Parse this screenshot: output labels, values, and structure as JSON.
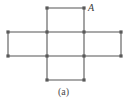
{
  "figure": {
    "caption": "(a)",
    "caption_x": 0,
    "caption_y": 86,
    "width": 127,
    "height": 103,
    "background": "#ffffff",
    "edge_color": "#8c8c8c",
    "edge_width": 1.6,
    "node_color": "#5a5a5a",
    "node_size": 3.2,
    "label_color": "#3a3a3a"
  },
  "labels": [
    {
      "text": "A",
      "x": 88,
      "y": 3,
      "target_vertex": "c2r0"
    }
  ],
  "diagram_data": {
    "type": "polyomino-grid-graph",
    "shape": "cross-pentomino",
    "columns_x": [
      8,
      47,
      84,
      121
    ],
    "rows_y": [
      8,
      32,
      56,
      80
    ],
    "cells": [
      {
        "id": "top",
        "col": 1,
        "row": 0
      },
      {
        "id": "left",
        "col": 0,
        "row": 1
      },
      {
        "id": "center",
        "col": 1,
        "row": 1
      },
      {
        "id": "right",
        "col": 2,
        "row": 1
      },
      {
        "id": "bottom",
        "col": 1,
        "row": 2
      }
    ],
    "vertices": [
      {
        "id": "c1r0",
        "x": 47,
        "y": 8
      },
      {
        "id": "c2r0",
        "x": 84,
        "y": 8
      },
      {
        "id": "c0r1",
        "x": 8,
        "y": 32
      },
      {
        "id": "c1r1",
        "x": 47,
        "y": 32
      },
      {
        "id": "c2r1",
        "x": 84,
        "y": 32
      },
      {
        "id": "c3r1",
        "x": 121,
        "y": 32
      },
      {
        "id": "c0r2",
        "x": 8,
        "y": 56
      },
      {
        "id": "c1r2",
        "x": 47,
        "y": 56
      },
      {
        "id": "c2r2",
        "x": 84,
        "y": 56
      },
      {
        "id": "c3r2",
        "x": 121,
        "y": 56
      },
      {
        "id": "c1r3",
        "x": 47,
        "y": 80
      },
      {
        "id": "c2r3",
        "x": 84,
        "y": 80
      }
    ],
    "edges": [
      {
        "from": "c1r0",
        "to": "c2r0"
      },
      {
        "from": "c1r0",
        "to": "c1r1"
      },
      {
        "from": "c2r0",
        "to": "c2r1"
      },
      {
        "from": "c0r1",
        "to": "c1r1"
      },
      {
        "from": "c1r1",
        "to": "c2r1"
      },
      {
        "from": "c2r1",
        "to": "c3r1"
      },
      {
        "from": "c0r1",
        "to": "c0r2"
      },
      {
        "from": "c1r1",
        "to": "c1r2"
      },
      {
        "from": "c2r1",
        "to": "c2r2"
      },
      {
        "from": "c3r1",
        "to": "c3r2"
      },
      {
        "from": "c0r2",
        "to": "c1r2"
      },
      {
        "from": "c1r2",
        "to": "c2r2"
      },
      {
        "from": "c2r2",
        "to": "c3r2"
      },
      {
        "from": "c1r2",
        "to": "c1r3"
      },
      {
        "from": "c2r2",
        "to": "c2r3"
      },
      {
        "from": "c1r3",
        "to": "c2r3"
      }
    ]
  }
}
